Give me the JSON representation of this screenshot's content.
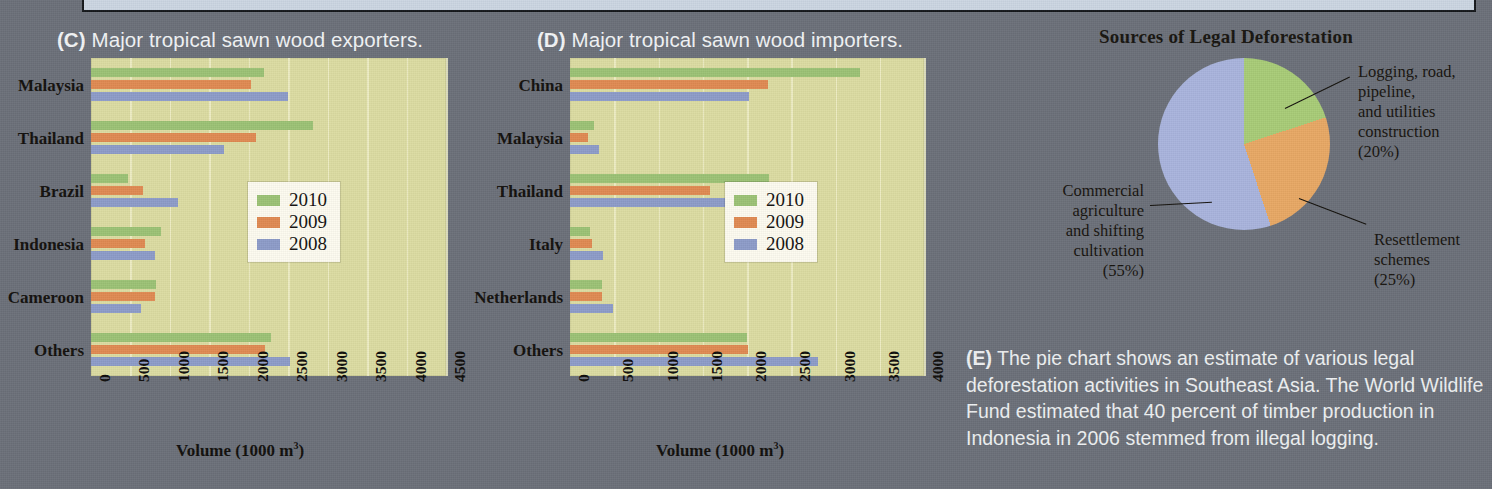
{
  "figure": {
    "panel_c_title_tag": "(C)",
    "panel_c_title_text": " Major tropical sawn wood exporters.",
    "panel_d_title_tag": "(D)",
    "panel_d_title_text": " Major tropical sawn wood importers.",
    "pie_title": "Sources of Legal Deforestation",
    "caption_tag": "(E)",
    "caption_text": " The pie chart shows an estimate of various legal deforestation activities in Southeast Asia. The World Wildlife Fund estimated that 40 percent of timber production in Indonesia in 2006 stemmed from illegal logging."
  },
  "colors": {
    "series_2010": "#9cc275",
    "series_2009": "#e08a52",
    "series_2008": "#8d9cc9",
    "plot_background": "#dcdca2",
    "page_background": "#6b7079",
    "gridline": "#f0efc8",
    "banner": "#ccd6e2"
  },
  "legend": {
    "items": [
      {
        "label": "2010",
        "color": "#9cc275"
      },
      {
        "label": "2009",
        "color": "#e08a52"
      },
      {
        "label": "2008",
        "color": "#8d9cc9"
      }
    ]
  },
  "chart_data": [
    {
      "type": "bar",
      "id": "panel-c",
      "title": "(C) Major tropical sawn wood exporters.",
      "orientation": "horizontal",
      "categories": [
        "Malaysia",
        "Thailand",
        "Brazil",
        "Indonesia",
        "Cameroon",
        "Others"
      ],
      "series": [
        {
          "name": "2010",
          "color": "#9cc275",
          "values": [
            2190,
            2810,
            470,
            890,
            820,
            2280
          ]
        },
        {
          "name": "2009",
          "color": "#e08a52",
          "values": [
            2030,
            2090,
            660,
            680,
            810,
            2200
          ]
        },
        {
          "name": "2008",
          "color": "#8d9cc9",
          "values": [
            2500,
            1690,
            1100,
            810,
            630,
            2520
          ]
        }
      ],
      "xlabel": "Volume (1000 m3)",
      "xlabel_html": "Volume (1000 m<sup>3</sup>)",
      "ylabel": "",
      "xlim": [
        0,
        4500
      ],
      "xticks": [
        "0",
        "500",
        "1000",
        "1500",
        "2000",
        "2500",
        "3000",
        "3500",
        "4000",
        "4500"
      ],
      "grid": true,
      "legend_position": "middle-right"
    },
    {
      "type": "bar",
      "id": "panel-d",
      "title": "(D) Major tropical sawn wood importers.",
      "orientation": "horizontal",
      "categories": [
        "China",
        "Malaysia",
        "Thailand",
        "Italy",
        "Netherlands",
        "Others"
      ],
      "series": [
        {
          "name": "2010",
          "color": "#9cc275",
          "values": [
            3280,
            270,
            2250,
            230,
            360,
            2000
          ]
        },
        {
          "name": "2009",
          "color": "#e08a52",
          "values": [
            2240,
            200,
            1580,
            250,
            360,
            2010
          ]
        },
        {
          "name": "2008",
          "color": "#8d9cc9",
          "values": [
            2020,
            330,
            2230,
            370,
            490,
            2800
          ]
        }
      ],
      "xlabel": "Volume (1000 m3)",
      "xlabel_html": "Volume (1000 m<sup>3</sup>)",
      "ylabel": "",
      "xlim": [
        0,
        4000
      ],
      "xticks": [
        "0",
        "500",
        "1000",
        "1500",
        "2000",
        "2500",
        "3000",
        "3500",
        "4000"
      ],
      "grid": true,
      "legend_position": "middle-right"
    },
    {
      "type": "pie",
      "id": "panel-e-pie",
      "title": "Sources of Legal Deforestation",
      "slices": [
        {
          "label": "Logging, road, pipeline, and utilities construction",
          "percent": 20,
          "percent_text": "(20%)",
          "color": "#a8cc77"
        },
        {
          "label": "Resettlement schemes",
          "percent": 25,
          "percent_text": "(25%)",
          "color": "#e8a864"
        },
        {
          "label": "Commercial agriculture and shifting cultivation",
          "percent": 55,
          "percent_text": "(55%)",
          "color": "#a9b4dd"
        }
      ],
      "labels": {
        "logging": "Logging, road,\npipeline,\nand utilities\nconstruction\n(20%)",
        "logging_line1": "Logging, road,",
        "logging_line2": "pipeline,",
        "logging_line3": "and utilities",
        "logging_line4": "construction",
        "logging_line5": "(20%)",
        "resettlement_line1": "Resettlement",
        "resettlement_line2": "schemes",
        "resettlement_line3": "(25%)",
        "commercial_line1": "Commercial",
        "commercial_line2": "agriculture",
        "commercial_line3": "and shifting",
        "commercial_line4": "cultivation",
        "commercial_line5": "(55%)"
      }
    }
  ]
}
